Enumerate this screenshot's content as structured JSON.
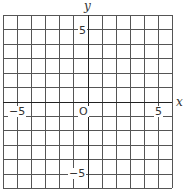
{
  "figure": {
    "type": "coordinate-grid",
    "x_axis_label": "x",
    "y_axis_label": "y",
    "origin_label": "O",
    "x_range": [
      -6,
      6
    ],
    "y_range": [
      -6,
      6
    ],
    "grid_step": 1,
    "tick_labels": {
      "x_neg": "−5",
      "x_pos": "5",
      "y_pos": "5",
      "y_neg": "−5"
    },
    "colors": {
      "grid": "#555555",
      "axis": "#222222",
      "background": "#ffffff"
    }
  }
}
